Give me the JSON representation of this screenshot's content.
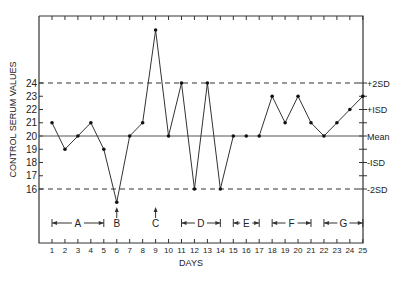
{
  "chart_data": {
    "type": "line",
    "title": "",
    "xlabel": "DAYS",
    "ylabel": "CONTROL SERUM VALUES",
    "x": [
      1,
      2,
      3,
      4,
      5,
      6,
      7,
      8,
      9,
      10,
      11,
      12,
      13,
      14,
      15,
      16,
      17,
      18,
      19,
      20,
      21,
      22,
      23,
      24,
      25
    ],
    "values": [
      21,
      19,
      20,
      21,
      19,
      15,
      20,
      21,
      28,
      20,
      24,
      16,
      24,
      16,
      20,
      20,
      20,
      23,
      21,
      23,
      21,
      20,
      21,
      22,
      23
    ],
    "segments_broken_between": [
      [
        15,
        16
      ],
      [
        16,
        17
      ]
    ],
    "y_ticks": [
      16,
      17,
      18,
      19,
      20,
      21,
      22,
      23,
      24
    ],
    "ylim": [
      13,
      29.5
    ],
    "xlim": [
      0,
      25
    ],
    "grid": false,
    "reference_lines": [
      {
        "value": 24,
        "label": "+2SD",
        "style": "dashed"
      },
      {
        "value": 22,
        "label": "+ISD",
        "style": "tick"
      },
      {
        "value": 20,
        "label": "Mean",
        "style": "solid"
      },
      {
        "value": 18,
        "label": "-ISD",
        "style": "tick"
      },
      {
        "value": 16,
        "label": "-2SD",
        "style": "dashed"
      }
    ],
    "annotations": [
      {
        "label": "A",
        "type": "range",
        "from": 1,
        "to": 5
      },
      {
        "label": "B",
        "type": "arrow",
        "at": 6
      },
      {
        "label": "C",
        "type": "arrow",
        "at": 9
      },
      {
        "label": "D",
        "type": "range",
        "from": 11,
        "to": 14
      },
      {
        "label": "E",
        "type": "range",
        "from": 15,
        "to": 17
      },
      {
        "label": "F",
        "type": "range",
        "from": 18,
        "to": 21
      },
      {
        "label": "G",
        "type": "range",
        "from": 22,
        "to": 25
      }
    ]
  }
}
